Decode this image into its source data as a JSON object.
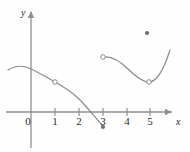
{
  "figure": {
    "background_color": "#fefefe",
    "stroke_color": "#8a8a8a",
    "axis_color": "#8f8f8f",
    "text_color": "#2b2b2b",
    "width": 190,
    "height": 152
  },
  "axes": {
    "x_axis": {
      "label": "x",
      "label_x": 176,
      "label_y": 117,
      "line_y": 112,
      "start_x": 6,
      "end_x": 172,
      "arrow": true
    },
    "y_axis": {
      "label": "y",
      "label_x": 21,
      "label_y": 8,
      "line_x": 31,
      "start_y": 12,
      "end_y": 148,
      "arrow": true
    },
    "origin_label": "0",
    "origin_label_x": 21,
    "origin_label_y": 116,
    "unit_px": 23.6,
    "ticks": [
      {
        "label": "1",
        "value": 1,
        "x": 55
      },
      {
        "label": "2",
        "value": 2,
        "x": 79
      },
      {
        "label": "3",
        "value": 3,
        "x": 103
      },
      {
        "label": "4",
        "value": 4,
        "x": 127
      },
      {
        "label": "5",
        "value": 5,
        "x": 150
      }
    ],
    "tick_label_y": 116,
    "tick_half_height": 4
  },
  "chart_data": {
    "type": "line",
    "title": "",
    "xlabel": "x",
    "ylabel": "y",
    "xlim": [
      -1,
      6.1
    ],
    "ylim": [
      -2.1,
      3.5
    ],
    "grid": false,
    "legend": null,
    "series": [
      {
        "name": "branch-left",
        "comment": "decreasing branch on the left, defined on approximately -1 to 3",
        "path": "M 8,70 C 14,66 20,65.5 26,67 C 34,69.5 44,76 55,82 C 64,87 72,92 79,99 C 86,106 95,117 103,126",
        "x": [
          -0.97,
          -0.2,
          0.3,
          1.0,
          2.0,
          2.4,
          3.0
        ],
        "y": [
          1.78,
          2.0,
          1.84,
          1.27,
          0.55,
          0.0,
          -0.6
        ]
      },
      {
        "name": "branch-right",
        "comment": "U shaped branch on the right, defined on approximately 3 to 5.9",
        "path": "M 103,57 C 112,55.5 120,61 128,69 C 135,76 142,82 149,82 C 156,82 163,72 170,50",
        "x": [
          3.0,
          3.6,
          4.2,
          5.0,
          5.6,
          5.9
        ],
        "y": [
          2.33,
          2.1,
          1.55,
          1.27,
          1.8,
          2.63
        ]
      }
    ],
    "points": [
      {
        "name": "open-point-branch-left-at-1",
        "kind": "open",
        "cx": 55,
        "cy": 82,
        "x": 1.0,
        "y": 1.27
      },
      {
        "name": "closed-endpoint-branch-left-at-3",
        "kind": "closed",
        "cx": 103,
        "cy": 127,
        "x": 3.0,
        "y": -0.64
      },
      {
        "name": "open-endpoint-branch-right-at-3",
        "kind": "open",
        "cx": 103,
        "cy": 57,
        "x": 3.0,
        "y": 2.33
      },
      {
        "name": "open-point-branch-right-at-5",
        "kind": "open",
        "cx": 149,
        "cy": 82,
        "x": 5.0,
        "y": 1.27
      },
      {
        "name": "isolated-closed-point",
        "kind": "closed",
        "cx": 147,
        "cy": 33,
        "x": 4.9,
        "y": 3.35
      }
    ]
  }
}
